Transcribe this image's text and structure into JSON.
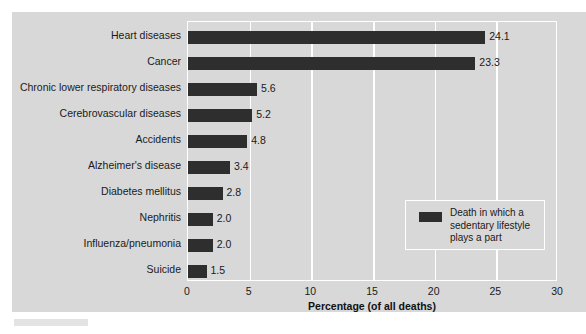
{
  "chart_data": {
    "type": "bar",
    "orientation": "horizontal",
    "title": "",
    "subtitle": "",
    "xlabel": "Percentage (of all deaths)",
    "ylabel": "",
    "xlim": [
      0,
      30
    ],
    "xticks": [
      "0",
      "5",
      "10",
      "15",
      "20",
      "25",
      "30"
    ],
    "grid": true,
    "legend_position": "inside-right",
    "categories": [
      "Heart diseases",
      "Cancer",
      "Chronic lower respiratory diseases",
      "Cerebrovascular diseases",
      "Accidents",
      "Alzheimer's disease",
      "Diabetes mellitus",
      "Nephritis",
      "Influenza/pneumonia",
      "Suicide"
    ],
    "values": [
      24.1,
      23.3,
      5.6,
      5.2,
      4.8,
      3.4,
      2.8,
      2.0,
      2.0,
      1.5
    ],
    "value_labels": [
      "24.1",
      "23.3",
      "5.6",
      "5.2",
      "4.8",
      "3.4",
      "2.8",
      "2.0",
      "2.0",
      "1.5"
    ],
    "series": [
      {
        "name": "Death in which a sedentary lifestyle plays a part",
        "color": "#2e2e2e",
        "values": [
          24.1,
          23.3,
          5.6,
          5.2,
          4.8,
          3.4,
          2.8,
          2.0,
          2.0,
          1.5
        ]
      }
    ],
    "legend": [
      {
        "label": "Death in which a sedentary lifestyle plays a part",
        "color": "#2e2e2e"
      }
    ]
  },
  "colors": {
    "bar": "#2e2e2e",
    "panel_background": "#d8d8d8",
    "gridline": "#ffffff",
    "text": "#1a1a1a",
    "page_background": "#ffffff"
  },
  "legend": {
    "line1": "Death in which a",
    "line2": "sedentary lifestyle",
    "line3": "plays a part"
  }
}
